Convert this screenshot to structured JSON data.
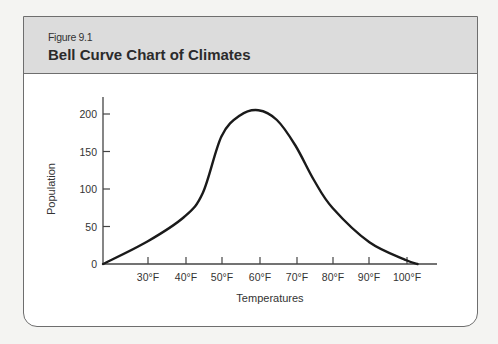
{
  "figure": {
    "number": "Figure 9.1",
    "title": "Bell Curve Chart of Climates"
  },
  "chart_data": {
    "type": "line",
    "title": "Bell Curve Chart of Climates",
    "xlabel": "Temperatures",
    "ylabel": "Population",
    "x_tick_labels": [
      "30°F",
      "40°F",
      "50°F",
      "60°F",
      "70°F",
      "80°F",
      "90°F",
      "100°F"
    ],
    "y_tick_labels": [
      "0",
      "50",
      "100",
      "150",
      "200"
    ],
    "ylim": [
      0,
      225
    ],
    "xlim_F": [
      18,
      108
    ],
    "grid": false,
    "legend": null,
    "series": [
      {
        "name": "Population",
        "x": [
          18,
          30,
          40,
          45,
          50,
          55,
          60,
          65,
          70,
          75,
          80,
          90,
          100,
          103
        ],
        "values": [
          0,
          30,
          63,
          95,
          170,
          198,
          205,
          192,
          158,
          112,
          75,
          29,
          5,
          0
        ]
      }
    ]
  },
  "colors": {
    "header_bg": "#dcdcdc",
    "panel_bg": "#ffffff",
    "page_bg": "#f4f4f2",
    "curve": "#1a1a1a",
    "axis": "#444444"
  }
}
